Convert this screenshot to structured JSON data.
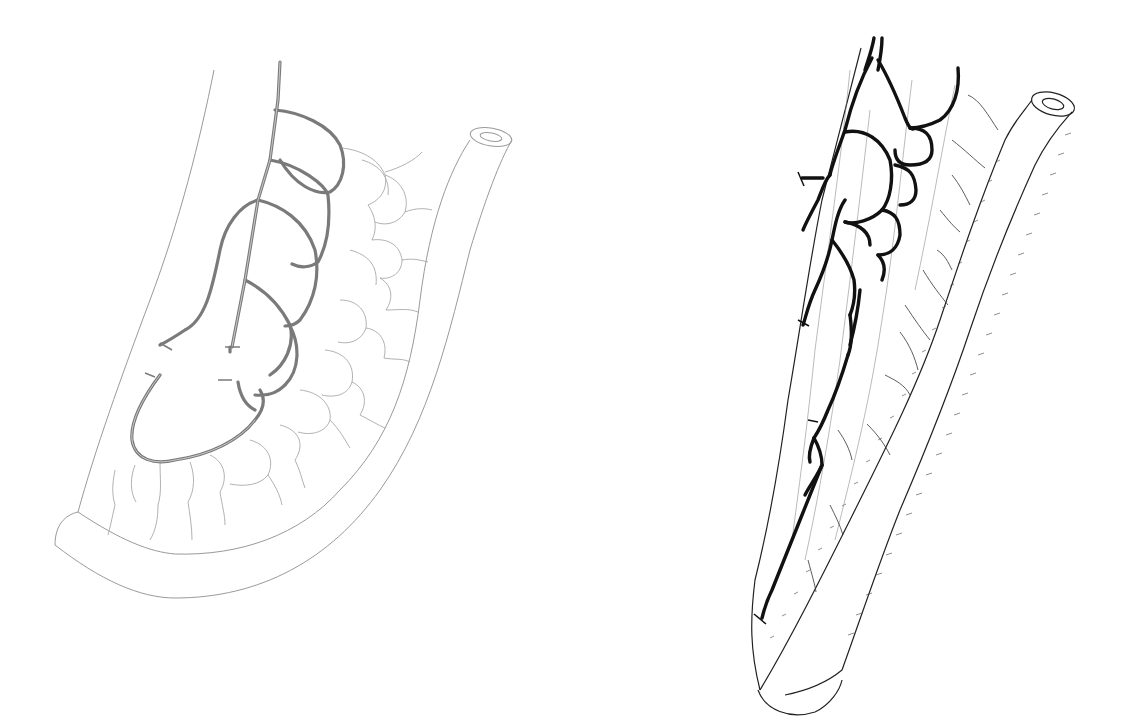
{
  "figure": {
    "background": "#ffffff",
    "panels": [
      {
        "id": "left",
        "description": "Curved bowel segment with mesenteric vascular arcades (gray line art)",
        "vessel_color": "#7a7a7a",
        "outline_color": "#9a9a9a"
      },
      {
        "id": "right",
        "description": "Straight bowel segment with mesenteric vascular network (black line art)",
        "vessel_color": "#111111",
        "outline_color": "#222222"
      }
    ]
  }
}
